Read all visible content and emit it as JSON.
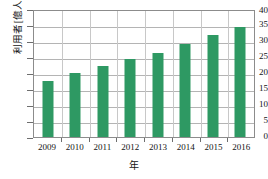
{
  "chart_data": {
    "type": "bar",
    "title": "",
    "subtitle": "",
    "xlabel": "年",
    "ylabel": "利用者[億人]",
    "categories": [
      "2009",
      "2010",
      "2011",
      "2012",
      "2013",
      "2014",
      "2015",
      "2016"
    ],
    "values": [
      17.5,
      20.0,
      22.2,
      24.4,
      26.3,
      29.1,
      31.9,
      34.4
    ],
    "series": [
      {
        "name": "利用者",
        "values": [
          17.5,
          20.0,
          22.2,
          24.4,
          26.3,
          29.1,
          31.9,
          34.4
        ]
      }
    ],
    "ylim": [
      0,
      40
    ],
    "ytick_values": [
      0,
      5,
      10,
      15,
      20,
      25,
      30,
      35,
      40
    ],
    "ytick_labels": [
      "0",
      "5",
      "10",
      "15",
      "20",
      "25",
      "30",
      "35",
      "40"
    ],
    "xtick_labels": [
      "2009",
      "2010",
      "2011",
      "2012",
      "2013",
      "2014",
      "2015",
      "2016"
    ],
    "grid": true,
    "grid_axis": "both",
    "legend": false,
    "legend_position": "none",
    "bar_color": "#2e9963",
    "frame_color": "#8c8c8c",
    "grid_color": "#b4b4b4",
    "text_color": "#141414",
    "background": "#ffffff"
  }
}
